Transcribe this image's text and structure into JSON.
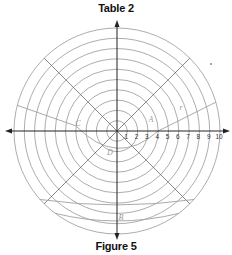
{
  "title": "Table 2",
  "caption": "Figure 5",
  "grid": {
    "center": [
      117,
      131
    ],
    "unit_px": 10.3,
    "rings": [
      1,
      2,
      3,
      4,
      5,
      6,
      7,
      8,
      9,
      10
    ],
    "radial_angles_deg": [
      45,
      135,
      225,
      315
    ],
    "tick_labels": [
      "1",
      "2",
      "3",
      "4",
      "5",
      "6",
      "7",
      "8",
      "9",
      "10"
    ],
    "line_color": "#8a8a8a",
    "axis_color": "#222222",
    "curve_color": "#a0a0a0"
  },
  "points": [
    {
      "label": "A",
      "x": 151,
      "y": 122
    },
    {
      "label": "C",
      "x": 78,
      "y": 126
    },
    {
      "label": "D",
      "x": 110,
      "y": 155
    },
    {
      "label": "B",
      "x": 121,
      "y": 220
    },
    {
      "label": "r",
      "x": 181,
      "y": 110
    }
  ]
}
